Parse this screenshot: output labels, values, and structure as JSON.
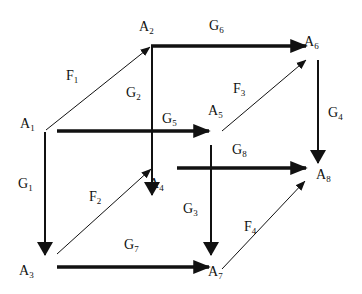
{
  "diagram": {
    "type": "cube-mapping-diagram",
    "nodes": [
      {
        "id": "A1",
        "label": "A",
        "sub": "1"
      },
      {
        "id": "A2",
        "label": "A",
        "sub": "2"
      },
      {
        "id": "A3",
        "label": "A",
        "sub": "3"
      },
      {
        "id": "A4",
        "label": "A",
        "sub": "4"
      },
      {
        "id": "A5",
        "label": "A",
        "sub": "5"
      },
      {
        "id": "A6",
        "label": "A",
        "sub": "6"
      },
      {
        "id": "A7",
        "label": "A",
        "sub": "7"
      },
      {
        "id": "A8",
        "label": "A",
        "sub": "8"
      }
    ],
    "edges": [
      {
        "id": "F1",
        "label": "F",
        "sub": "1",
        "from": "A1",
        "to": "A2",
        "style": "thin"
      },
      {
        "id": "F2",
        "label": "F",
        "sub": "2",
        "from": "A3",
        "to": "A4",
        "style": "thin"
      },
      {
        "id": "F3",
        "label": "F",
        "sub": "3",
        "from": "A5",
        "to": "A6",
        "style": "thin"
      },
      {
        "id": "F4",
        "label": "F",
        "sub": "4",
        "from": "A7",
        "to": "A8",
        "style": "thin"
      },
      {
        "id": "G1",
        "label": "G",
        "sub": "1",
        "from": "A1",
        "to": "A3",
        "style": "medium"
      },
      {
        "id": "G2",
        "label": "G",
        "sub": "2",
        "from": "A2",
        "to": "A4",
        "style": "medium"
      },
      {
        "id": "G3",
        "label": "G",
        "sub": "3",
        "from": "A5",
        "to": "A7",
        "style": "medium"
      },
      {
        "id": "G4",
        "label": "G",
        "sub": "4",
        "from": "A6",
        "to": "A8",
        "style": "medium"
      },
      {
        "id": "G5",
        "label": "G",
        "sub": "5",
        "from": "A1",
        "to": "A5",
        "style": "thick"
      },
      {
        "id": "G6",
        "label": "G",
        "sub": "6",
        "from": "A2",
        "to": "A6",
        "style": "thick"
      },
      {
        "id": "G7",
        "label": "G",
        "sub": "7",
        "from": "A3",
        "to": "A7",
        "style": "thick"
      },
      {
        "id": "G8",
        "label": "G",
        "sub": "8",
        "from": "A4",
        "to": "A8",
        "style": "thick"
      }
    ],
    "colors": {
      "line": "#111111",
      "background": "#ffffff"
    }
  }
}
